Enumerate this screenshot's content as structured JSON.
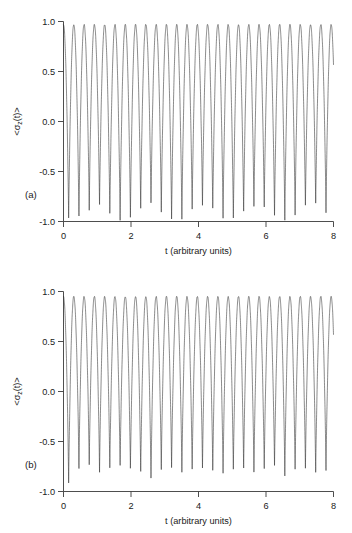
{
  "figure": {
    "background_color": "#ffffff",
    "curve_color": "#2b2b2b",
    "axis_color": "#3a3a3a"
  },
  "panels": [
    {
      "tag": "(a)",
      "xlabel": "t (arbitrary units)",
      "ylabel": "<σz(t)>",
      "ylabel_parts": {
        "open": "<σ",
        "sub": "z",
        "close": "(t)>"
      },
      "xticks": [
        "0",
        "2",
        "4",
        "6",
        "8"
      ],
      "yticks": [
        "1.0",
        "0.5",
        "0.0",
        "-0.5",
        "-1.0"
      ]
    },
    {
      "tag": "(b)",
      "xlabel": "t (arbitrary units)",
      "ylabel": "<σz(t)>",
      "ylabel_parts": {
        "open": "<σ",
        "sub": "z",
        "close": "(t)>"
      },
      "xticks": [
        "0",
        "2",
        "4",
        "6",
        "8"
      ],
      "yticks": [
        "1.0",
        "0.5",
        "0.0",
        "-0.5",
        "-1.0"
      ]
    }
  ],
  "chart_data": [
    {
      "type": "line",
      "panel": "(a)",
      "title": "",
      "xlabel": "t (arbitrary units)",
      "ylabel": "<σz(t)>",
      "xlim": [
        0,
        8
      ],
      "ylim": [
        -1.0,
        1.0
      ],
      "xticks": [
        0,
        2,
        4,
        6,
        8
      ],
      "yticks": [
        -1.0,
        -0.5,
        0.0,
        0.5,
        1.0
      ],
      "grid": false,
      "legend": null,
      "description": "Rapid Rabi-like oscillations of the atomic inversion between -1 and +1 with rounded maxima near +0.97 and sharp minima whose depth is modulated; about 26 oscillations across t = 0 to 8.",
      "n_oscillations": 26,
      "period": 0.305,
      "peak_value": 0.97,
      "trough_envelope": [
        -1.0,
        -0.98,
        -0.9,
        -0.86,
        -0.95,
        -1.0,
        -0.97,
        -0.88,
        -0.84,
        -0.92,
        -1.0,
        -0.99,
        -0.9,
        -0.85,
        -0.9,
        -0.98,
        -1.0,
        -0.93,
        -0.86,
        -0.88,
        -0.96,
        -1.0,
        -0.95,
        -0.87,
        -0.85,
        -0.93
      ],
      "series": [
        {
          "name": "<σz(t)>",
          "color": "#2b2b2b",
          "x": [
            0,
            0.31,
            0.61,
            0.92,
            1.22,
            1.53,
            1.84,
            2.14,
            2.45,
            2.75,
            3.06,
            3.37,
            3.67,
            3.98,
            4.28,
            4.59,
            4.9,
            5.2,
            5.51,
            5.81,
            6.12,
            6.43,
            6.73,
            7.04,
            7.34,
            7.65,
            8.0
          ],
          "values": [
            0.97,
            0.97,
            0.96,
            0.97,
            0.96,
            0.97,
            0.96,
            0.97,
            0.96,
            0.97,
            0.96,
            0.97,
            0.96,
            0.97,
            0.96,
            0.97,
            0.96,
            0.97,
            0.96,
            0.97,
            0.96,
            0.97,
            0.96,
            0.97,
            0.96,
            0.97,
            0.9
          ]
        }
      ]
    },
    {
      "type": "line",
      "panel": "(b)",
      "title": "",
      "xlabel": "t (arbitrary units)",
      "ylabel": "<σz(t)>",
      "xlim": [
        0,
        8
      ],
      "ylim": [
        -1.0,
        1.0
      ],
      "xticks": [
        0,
        2,
        4,
        6,
        8
      ],
      "yticks": [
        -1.0,
        -0.5,
        0.0,
        0.5,
        1.0
      ],
      "grid": false,
      "legend": null,
      "description": "Same rapid oscillations as panel (a) but with shallower and more irregular minima, most troughs reaching only about -0.75 to -0.9 instead of -1.0.",
      "n_oscillations": 26,
      "period": 0.305,
      "peak_value": 0.95,
      "trough_envelope": [
        -0.93,
        -0.78,
        -0.76,
        -0.82,
        -0.79,
        -0.77,
        -0.8,
        -0.83,
        -0.9,
        -0.79,
        -0.77,
        -0.82,
        -0.8,
        -0.78,
        -0.81,
        -0.84,
        -0.8,
        -0.78,
        -0.82,
        -0.79,
        -0.77,
        -0.86,
        -0.8,
        -0.78,
        -0.83,
        -0.8
      ],
      "series": [
        {
          "name": "<σz(t)>",
          "color": "#2b2b2b",
          "x": [
            0,
            0.31,
            0.61,
            0.92,
            1.22,
            1.53,
            1.84,
            2.14,
            2.45,
            2.75,
            3.06,
            3.37,
            3.67,
            3.98,
            4.28,
            4.59,
            4.9,
            5.2,
            5.51,
            5.81,
            6.12,
            6.43,
            6.73,
            7.04,
            7.34,
            7.65,
            8.0
          ],
          "values": [
            0.95,
            0.95,
            0.94,
            0.95,
            0.94,
            0.95,
            0.94,
            0.95,
            0.94,
            0.95,
            0.94,
            0.95,
            0.94,
            0.95,
            0.94,
            0.95,
            0.94,
            0.95,
            0.94,
            0.95,
            0.94,
            0.95,
            0.94,
            0.95,
            0.94,
            0.95,
            0.82
          ]
        }
      ]
    }
  ]
}
